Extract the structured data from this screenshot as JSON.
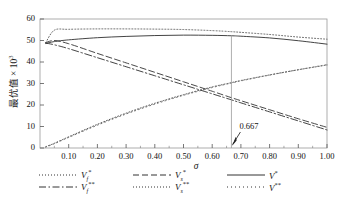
{
  "chart_data": {
    "type": "line",
    "title": "",
    "xlabel": "σ",
    "ylabel": "最优值 × 10",
    "ylabel_exponent": "3",
    "xlim": [
      0.0,
      1.0
    ],
    "ylim": [
      0,
      60
    ],
    "grid": false,
    "xticks": [
      "0.10",
      "0.20",
      "0.30",
      "0.40",
      "0.50",
      "0.60",
      "0.70",
      "0.80",
      "0.90",
      "1.00"
    ],
    "xtick_values": [
      0.1,
      0.2,
      0.3,
      0.4,
      0.5,
      0.6,
      0.7,
      0.8,
      0.9,
      1.0
    ],
    "yticks": [
      "0",
      "10",
      "20",
      "30",
      "40",
      "50",
      "60"
    ],
    "ytick_values": [
      0,
      10,
      20,
      30,
      40,
      50,
      60
    ],
    "legend_position": "below",
    "annotations": [
      {
        "label": "0.667",
        "x": 0.667,
        "kind": "vertical-line-with-arrow"
      }
    ],
    "series": [
      {
        "name": "Vf*",
        "label_base": "V",
        "label_sub": "f",
        "label_sup": "*",
        "style": "dotted",
        "color": "#555555",
        "x": [
          0.02,
          0.05,
          0.1,
          0.2,
          0.3,
          0.4,
          0.5,
          0.6,
          0.667,
          0.7,
          0.8,
          0.9,
          1.0
        ],
        "y": [
          49.0,
          54.8,
          55.2,
          55.4,
          55.4,
          55.3,
          55.1,
          54.6,
          54.1,
          53.8,
          52.8,
          51.6,
          50.6
        ]
      },
      {
        "name": "Vs*",
        "label_base": "V",
        "label_sub": "s",
        "label_sup": "*",
        "style": "dashed",
        "color": "#333333",
        "x": [
          0.02,
          0.05,
          0.1,
          0.2,
          0.3,
          0.4,
          0.5,
          0.6,
          0.667,
          0.7,
          0.8,
          0.9,
          1.0
        ],
        "y": [
          49.0,
          50.0,
          48.5,
          44.0,
          39.6,
          35.2,
          30.8,
          26.4,
          23.4,
          22.0,
          17.8,
          13.6,
          9.6
        ]
      },
      {
        "name": "V*",
        "label_base": "V",
        "label_sub": "",
        "label_sup": "*",
        "style": "solid",
        "color": "#3a3a3a",
        "x": [
          0.02,
          0.05,
          0.1,
          0.2,
          0.3,
          0.4,
          0.5,
          0.6,
          0.667,
          0.7,
          0.8,
          0.9,
          1.0
        ],
        "y": [
          48.6,
          49.5,
          50.3,
          51.3,
          51.9,
          52.3,
          52.5,
          52.4,
          52.2,
          52.0,
          51.2,
          49.9,
          48.3
        ]
      },
      {
        "name": "Vf**",
        "label_base": "V",
        "label_sub": "f",
        "label_sup": "**",
        "style": "dash-dot",
        "color": "#2e2e2e",
        "x": [
          0.02,
          0.05,
          0.1,
          0.2,
          0.3,
          0.4,
          0.5,
          0.6,
          0.667,
          0.7,
          0.8,
          0.9,
          1.0
        ],
        "y": [
          48.8,
          48.0,
          46.2,
          42.0,
          37.8,
          33.6,
          29.4,
          25.2,
          22.4,
          21.0,
          16.8,
          12.6,
          8.4
        ]
      },
      {
        "name": "Vs**",
        "label_base": "V",
        "label_sub": "s",
        "label_sup": "**",
        "style": "dotted",
        "color": "#444444",
        "x": [
          0.02,
          0.05,
          0.1,
          0.2,
          0.3,
          0.4,
          0.5,
          0.6,
          0.667,
          0.7,
          0.8,
          0.9,
          1.0
        ],
        "y": [
          0.6,
          2.2,
          5.2,
          11.0,
          16.2,
          20.8,
          24.8,
          28.4,
          30.4,
          31.4,
          34.0,
          36.4,
          38.6
        ]
      },
      {
        "name": "V**",
        "label_base": "V",
        "label_sub": "",
        "label_sup": "**",
        "style": "dotted-sparse",
        "color": "#666666",
        "x": [
          0.02,
          0.05,
          0.1,
          0.2,
          0.3,
          0.4,
          0.5,
          0.6,
          0.667,
          0.7,
          0.8,
          0.9,
          1.0
        ],
        "y": [
          0.4,
          2.0,
          4.9,
          10.6,
          15.8,
          20.4,
          24.5,
          28.1,
          30.2,
          31.2,
          33.9,
          36.4,
          38.8
        ]
      }
    ]
  },
  "legend": {
    "rows": [
      [
        {
          "sample": "dotted",
          "text_html": "V<sub>f</sub><sup>*</sup>"
        },
        {
          "sample": "dashed",
          "text_html": "V<sub>s</sub><sup>*</sup>"
        },
        {
          "sample": "solid",
          "text_html": "V<sup>*</sup>"
        }
      ],
      [
        {
          "sample": "dash-dot",
          "text_html": "V<sub>f</sub><sup>**</sup>"
        },
        {
          "sample": "dotted",
          "text_html": "V<sub>s</sub><sup>**</sup>"
        },
        {
          "sample": "dotted-sparse",
          "text_html": "V<sup>**</sup>"
        }
      ]
    ]
  }
}
